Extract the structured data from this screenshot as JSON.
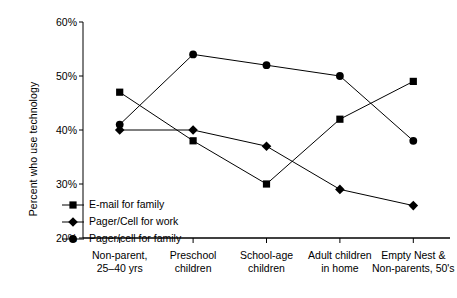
{
  "chart_data": {
    "type": "line",
    "title": "",
    "xlabel": "",
    "ylabel": "Percent who use technology",
    "ylim": [
      20,
      60
    ],
    "ytick_values": [
      20,
      30,
      40,
      50,
      60
    ],
    "ytick_labels": [
      "20%",
      "30%",
      "40%",
      "50%",
      "60%"
    ],
    "grid": false,
    "legend_position": "inside-lower-left",
    "categories": [
      "Non-parent, 25–40 yrs",
      "Preschool children",
      "School-age children",
      "Adult children in home",
      "Empty Nest & Non-parents, 50's"
    ],
    "category_lines": [
      [
        "Non-parent,",
        "25–40 yrs"
      ],
      [
        "Preschool",
        "children"
      ],
      [
        "School-age",
        "children"
      ],
      [
        "Adult children",
        "in home"
      ],
      [
        "Empty Nest &",
        "Non-parents, 50's"
      ]
    ],
    "series": [
      {
        "name": "E-mail for family",
        "marker": "square",
        "color": "#000000",
        "values": [
          47,
          38,
          30,
          42,
          49
        ]
      },
      {
        "name": "Pager/Cell for work",
        "marker": "diamond",
        "color": "#000000",
        "values": [
          40,
          40,
          37,
          29,
          26
        ]
      },
      {
        "name": "Pager/cell for family",
        "marker": "circle",
        "color": "#000000",
        "values": [
          41,
          54,
          52,
          50,
          38
        ]
      }
    ]
  }
}
